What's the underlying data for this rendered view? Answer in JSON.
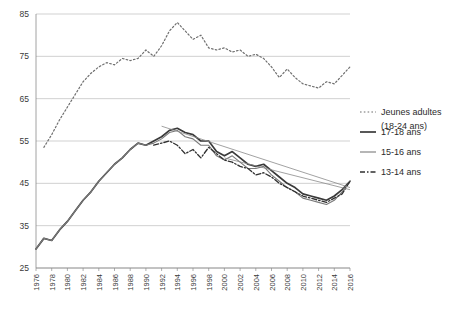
{
  "chart_data": {
    "type": "line",
    "title": "",
    "xlabel": "",
    "ylabel": "",
    "xlim": [
      1976,
      2016
    ],
    "ylim": [
      25,
      85
    ],
    "yticks": [
      25,
      35,
      45,
      55,
      65,
      75,
      85
    ],
    "xticks": [
      1976,
      1978,
      1980,
      1982,
      1984,
      1986,
      1988,
      1990,
      1992,
      1994,
      1996,
      1998,
      2000,
      2002,
      2004,
      2006,
      2008,
      2010,
      2012,
      2014,
      2016
    ],
    "grid": "horizontal",
    "legend_position": "right",
    "series": [
      {
        "name": "Jeunes adultes (18-24 ans)",
        "style": "dotted",
        "color": "#6f6f6f",
        "x": [
          1977,
          1978,
          1979,
          1980,
          1981,
          1982,
          1983,
          1984,
          1985,
          1986,
          1987,
          1988,
          1989,
          1990,
          1991,
          1992,
          1993,
          1994,
          1995,
          1996,
          1997,
          1998,
          1999,
          2000,
          2001,
          2002,
          2003,
          2004,
          2005,
          2006,
          2007,
          2008,
          2009,
          2010,
          2011,
          2012,
          2013,
          2014,
          2015,
          2016
        ],
        "values": [
          53.5,
          56.5,
          60.0,
          63.0,
          66.0,
          69.0,
          71.0,
          72.5,
          73.5,
          73.0,
          74.5,
          74.0,
          74.5,
          76.5,
          75.0,
          77.5,
          81.0,
          83.0,
          81.0,
          79.0,
          80.0,
          77.0,
          76.5,
          77.0,
          76.0,
          76.5,
          75.0,
          75.5,
          74.5,
          72.5,
          70.0,
          72.0,
          70.0,
          68.5,
          68.0,
          67.5,
          69.0,
          68.5,
          70.5,
          72.5
        ]
      },
      {
        "name": "17-18 ans",
        "style": "solid",
        "color": "#3a3a3a",
        "x": [
          1976,
          1977,
          1978,
          1979,
          1980,
          1981,
          1982,
          1983,
          1984,
          1985,
          1986,
          1987,
          1988,
          1989,
          1990,
          1991,
          1992,
          1993,
          1994,
          1995,
          1996,
          1997,
          1998,
          1999,
          2000,
          2001,
          2002,
          2003,
          2004,
          2005,
          2006,
          2007,
          2008,
          2009,
          2010,
          2011,
          2012,
          2013,
          2014,
          2015,
          2016
        ],
        "values": [
          29.5,
          32.0,
          31.5,
          34.0,
          36.0,
          38.5,
          41.0,
          43.0,
          45.5,
          47.5,
          49.5,
          51.0,
          53.0,
          54.5,
          54.0,
          55.0,
          56.0,
          57.5,
          58.0,
          57.0,
          56.5,
          55.0,
          55.0,
          52.5,
          51.5,
          52.5,
          51.0,
          49.5,
          49.0,
          49.5,
          48.0,
          46.5,
          45.0,
          44.0,
          42.5,
          42.0,
          41.5,
          41.0,
          42.0,
          43.5,
          45.5
        ]
      },
      {
        "name": "15-16 ans",
        "style": "solid-thin",
        "color": "#7a7a7a",
        "x": [
          1976,
          1977,
          1978,
          1979,
          1980,
          1981,
          1982,
          1983,
          1984,
          1985,
          1986,
          1987,
          1988,
          1989,
          1990,
          1991,
          1992,
          1993,
          1994,
          1995,
          1996,
          1997,
          1998,
          1999,
          2000,
          2001,
          2002,
          2003,
          2004,
          2005,
          2006,
          2007,
          2008,
          2009,
          2010,
          2011,
          2012,
          2013,
          2014,
          2015,
          2016
        ],
        "values": [
          29.5,
          32.0,
          31.5,
          34.0,
          36.0,
          38.5,
          41.0,
          43.0,
          45.5,
          47.5,
          49.5,
          51.0,
          53.0,
          54.5,
          54.0,
          54.5,
          55.5,
          57.0,
          57.5,
          56.0,
          55.5,
          54.0,
          54.0,
          51.5,
          50.5,
          51.5,
          50.0,
          48.5,
          48.5,
          49.0,
          47.0,
          45.5,
          44.0,
          43.0,
          41.5,
          41.0,
          40.5,
          40.0,
          41.0,
          43.0,
          45.5
        ]
      },
      {
        "name": "13-14 ans",
        "style": "dashdot",
        "color": "#2f2f2f",
        "x": [
          1991,
          1992,
          1993,
          1994,
          1995,
          1996,
          1997,
          1998,
          1999,
          2000,
          2001,
          2002,
          2003,
          2004,
          2005,
          2006,
          2007,
          2008,
          2009,
          2010,
          2011,
          2012,
          2013,
          2014,
          2015,
          2016
        ],
        "values": [
          54.0,
          54.5,
          55.0,
          54.0,
          52.0,
          53.0,
          51.0,
          53.5,
          52.0,
          50.5,
          50.0,
          49.0,
          48.5,
          47.0,
          47.5,
          46.5,
          45.0,
          44.0,
          43.0,
          42.0,
          41.5,
          41.0,
          40.5,
          41.5,
          42.5,
          45.5
        ]
      }
    ],
    "trend_lines": [
      {
        "name": "trend-17-18",
        "x": [
          1992,
          2016
        ],
        "y": [
          58.5,
          44.0
        ]
      },
      {
        "name": "trend-13-14",
        "x": [
          2000,
          2016
        ],
        "y": [
          51.0,
          43.5
        ]
      }
    ]
  },
  "legend": {
    "items": [
      {
        "label_line1": "Jeunes adultes",
        "label_line2": "(18-24 ans)",
        "style": "dotted"
      },
      {
        "label_line1": "17-18 ans",
        "label_line2": "",
        "style": "solid"
      },
      {
        "label_line1": "15-16 ans",
        "label_line2": "",
        "style": "solid-thin"
      },
      {
        "label_line1": "13-14 ans",
        "label_line2": "",
        "style": "dashdot"
      }
    ]
  }
}
